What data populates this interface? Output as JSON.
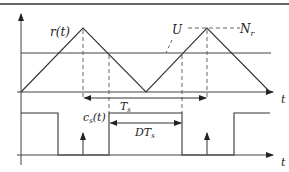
{
  "diagram": {
    "upper_plot": {
      "carrier_label": "r(t)",
      "reference_label": "U",
      "peak_label": "N_r",
      "peak_label_main": "N",
      "peak_label_sub": "r",
      "axis_label": "t",
      "period_label": "T_s",
      "period_label_main": "T",
      "period_label_sub": "s"
    },
    "lower_plot": {
      "signal_label": "c_s(t)",
      "signal_label_main": "c",
      "signal_label_sub": "s",
      "signal_label_rest": "(t)",
      "duty_label": "DT_s",
      "duty_label_main": "DT",
      "duty_label_sub": "s",
      "axis_label": "t"
    },
    "colors": {
      "stroke": "#333333",
      "background": "#ffffff"
    }
  }
}
